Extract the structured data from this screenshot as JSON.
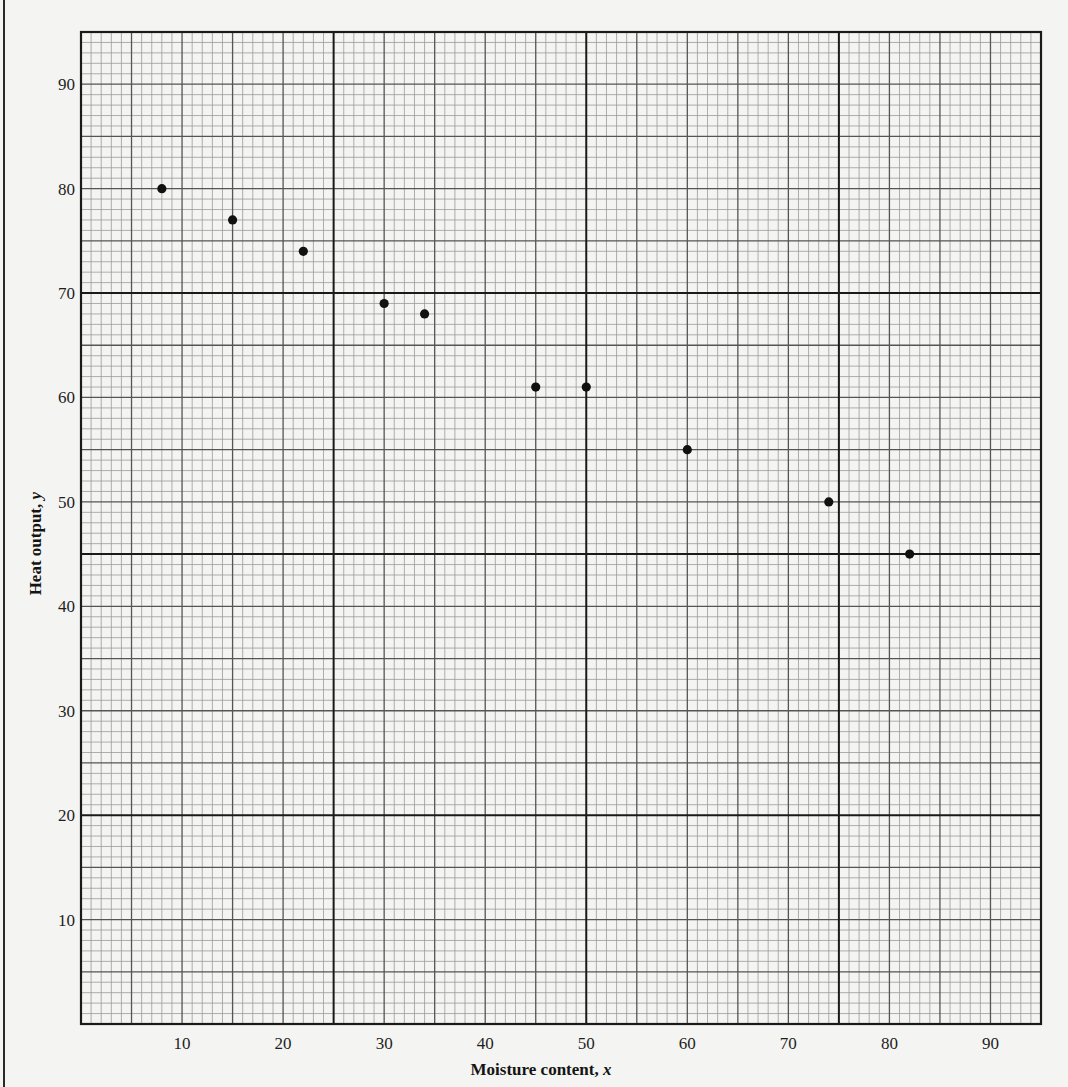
{
  "chart_data": {
    "type": "scatter",
    "title": "",
    "xlabel": "Moisture content, x",
    "ylabel": "Heat output, y",
    "xlabel_text": "Moisture content, ",
    "xlabel_var": "x",
    "ylabel_text": "Heat output, ",
    "ylabel_var": "y",
    "xlim": [
      0,
      95
    ],
    "ylim": [
      0,
      95
    ],
    "x_ticks": [
      10,
      20,
      30,
      40,
      50,
      60,
      70,
      80,
      90
    ],
    "y_ticks": [
      10,
      20,
      30,
      40,
      50,
      60,
      70,
      80,
      90
    ],
    "grid": {
      "on": true,
      "minor_step": 1,
      "medium_step": 5,
      "major_step": 25,
      "major_offset_y": 20
    },
    "legend": null,
    "series": [
      {
        "name": "observations",
        "marker": "filled-circle",
        "color": "#111111",
        "points": [
          {
            "x": 8,
            "y": 80
          },
          {
            "x": 15,
            "y": 77
          },
          {
            "x": 22,
            "y": 74
          },
          {
            "x": 30,
            "y": 69
          },
          {
            "x": 34,
            "y": 68
          },
          {
            "x": 45,
            "y": 61
          },
          {
            "x": 50,
            "y": 61
          },
          {
            "x": 60,
            "y": 55
          },
          {
            "x": 74,
            "y": 50
          },
          {
            "x": 82,
            "y": 45
          }
        ]
      }
    ],
    "colors": {
      "paper": "#f4f4f2",
      "minor_grid": "#9a9a9a",
      "medium_grid": "#555555",
      "major_grid": "#1a1a1a",
      "marker": "#111111"
    }
  }
}
